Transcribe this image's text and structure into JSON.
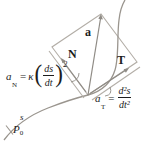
{
  "figure": {
    "vectors": {
      "normal_label": "N",
      "acceleration_label": "a",
      "tangent_label": "T"
    },
    "formula_normal": {
      "base": "a",
      "sub": "N",
      "eq": "=",
      "coef": "κ",
      "open_paren": "(",
      "num": "ds",
      "den": "dt",
      "close_paren": ")",
      "exponent": "2"
    },
    "formula_tangential": {
      "base": "a",
      "sub": "T",
      "eq": "=",
      "num": "d²s",
      "den": "dt²"
    },
    "curve": {
      "param_label": "s",
      "start_point_base": "P",
      "start_point_sub": "0"
    },
    "colors": {
      "stroke": "#b3aea7",
      "curve_stroke": "#9a958e",
      "arrow": "#8f8b85",
      "text": "#1c1c1c"
    }
  }
}
